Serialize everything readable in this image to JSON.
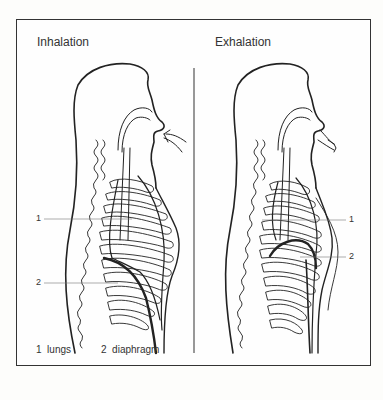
{
  "diagram": {
    "panels": [
      {
        "title": "Inhalation",
        "callouts": [
          "1",
          "2"
        ]
      },
      {
        "title": "Exhalation",
        "callouts": [
          "1",
          "2"
        ]
      }
    ],
    "legend": [
      {
        "number": "1",
        "label": "lungs",
        "text": "1  lungs"
      },
      {
        "number": "2",
        "label": "diaphragm",
        "text": "2  diaphragm"
      }
    ],
    "colors": {
      "line": "#222222",
      "background": "#fefefe",
      "frame": "#333333"
    }
  }
}
